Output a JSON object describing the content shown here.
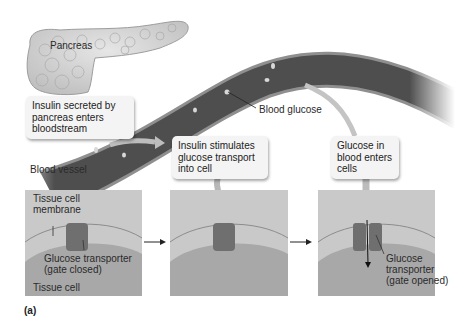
{
  "figure": {
    "panel_tag": "(a)",
    "labels": {
      "pancreas": "Pancreas",
      "blood_glucose": "Blood glucose",
      "blood_vessel": "Blood vessel",
      "tissue_cell_membrane": "Tissue cell\nmembrane",
      "transporter_closed": "Glucose transporter\n(gate closed)",
      "tissue_cell": "Tissue cell",
      "transporter_opened": "Glucose\ntransporter\n(gate opened)"
    },
    "callouts": {
      "step1": "Insulin secreted by\npancreas enters\nbloodstream",
      "step2": "Insulin stimulates\nglucose transport\ninto cell",
      "step3": "Glucose in\nblood enters\ncells"
    },
    "colors": {
      "vessel_dark": "#4a4a4a",
      "vessel_wall": "#8a8a8a",
      "panel_bg": "#c9c9c9",
      "cell_body": "#a6a6a6",
      "transporter": "#6e6e6e",
      "callout_bg": "#f4f4f4"
    }
  }
}
